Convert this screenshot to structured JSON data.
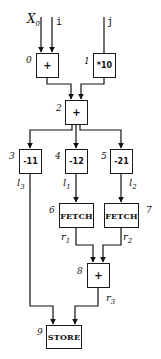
{
  "inputs": [
    {
      "id": "x0",
      "label": "X",
      "sub": "0"
    },
    {
      "id": "i",
      "label": "i"
    },
    {
      "id": "j",
      "label": "j"
    }
  ],
  "nodes": [
    {
      "id": 0,
      "number": "0",
      "op": "+"
    },
    {
      "id": 1,
      "number": "1",
      "op": "*10"
    },
    {
      "id": 2,
      "number": "2",
      "op": "+"
    },
    {
      "id": 3,
      "number": "3",
      "op": "-11"
    },
    {
      "id": 4,
      "number": "4",
      "op": "-12"
    },
    {
      "id": 5,
      "number": "5",
      "op": "-21"
    },
    {
      "id": 6,
      "number": "6",
      "op": "FETCH"
    },
    {
      "id": 7,
      "number": "7",
      "op": "FETCH"
    },
    {
      "id": 8,
      "number": "8",
      "op": "+"
    },
    {
      "id": 9,
      "number": "9",
      "op": "STORE"
    }
  ],
  "edge_labels": {
    "l3": {
      "base": "l",
      "sub": "3"
    },
    "l1": {
      "base": "l",
      "sub": "1"
    },
    "l2": {
      "base": "l",
      "sub": "2"
    },
    "r1": {
      "base": "r",
      "sub": "1"
    },
    "r2": {
      "base": "r",
      "sub": "2"
    },
    "r3": {
      "base": "r",
      "sub": "3"
    }
  },
  "edges": [
    [
      "X0",
      0
    ],
    [
      "i",
      0
    ],
    [
      "j",
      1
    ],
    [
      0,
      2
    ],
    [
      1,
      2
    ],
    [
      2,
      3
    ],
    [
      2,
      4
    ],
    [
      2,
      5
    ],
    [
      4,
      6
    ],
    [
      5,
      7
    ],
    [
      6,
      8
    ],
    [
      7,
      8
    ],
    [
      3,
      9
    ],
    [
      8,
      9
    ]
  ]
}
